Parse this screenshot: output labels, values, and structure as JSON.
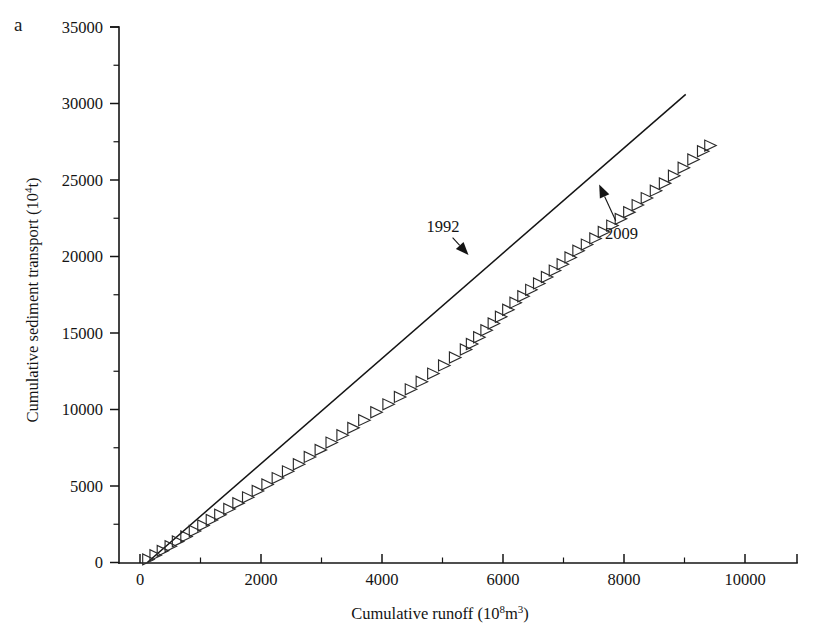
{
  "figure": {
    "panel_label": "a",
    "background_color": "#ffffff",
    "ink_color": "#141414"
  },
  "chart_data": {
    "type": "scatter",
    "title": "",
    "subtitle": "",
    "xlabel": "Cumulative runoff (10⁸m³)",
    "xlabel_parts": {
      "text": "Cumulative runoff (10",
      "sup": "8",
      "tail": "m",
      "sup2": "3",
      "close": ")"
    },
    "ylabel": "Cumulative sediment transport (10⁴t)",
    "ylabel_parts": {
      "text": "Cumulative sediment transport (10",
      "sup": "4",
      "tail": "t)"
    },
    "xlim": [
      0,
      10850
    ],
    "ylim": [
      0,
      35000
    ],
    "xticks": [
      0,
      2000,
      4000,
      6000,
      8000,
      10000
    ],
    "xtick_labels": [
      "0",
      "2000",
      "4000",
      "6000",
      "8000",
      "10000"
    ],
    "xticks_minor": [
      1000,
      3000,
      5000,
      7000,
      9000
    ],
    "yticks": [
      0,
      5000,
      10000,
      15000,
      20000,
      25000,
      30000,
      35000
    ],
    "ytick_labels": [
      "0",
      "5000",
      "10000",
      "15000",
      "20000",
      "25000",
      "30000",
      "35000"
    ],
    "yticks_minor": [
      2500,
      7500,
      12500,
      17500,
      22500,
      27500,
      32500
    ],
    "grid": false,
    "legend": false,
    "marker": "open-right-triangle",
    "series": [
      {
        "name": "Cumulative sediment transport vs cumulative runoff",
        "marker_color": "#2b2b2b",
        "x": [
          130,
          250,
          370,
          500,
          620,
          760,
          900,
          1040,
          1180,
          1320,
          1470,
          1620,
          1780,
          1940,
          2100,
          2270,
          2440,
          2620,
          2800,
          2980,
          3160,
          3340,
          3520,
          3700,
          3900,
          4100,
          4290,
          4470,
          4650,
          4840,
          5020,
          5200,
          5380,
          5480,
          5600,
          5720,
          5840,
          5960,
          6080,
          6200,
          6330,
          6460,
          6590,
          6720,
          6850,
          6980,
          7110,
          7240,
          7380,
          7520,
          7660,
          7800,
          7940,
          8080,
          8220,
          8370,
          8520,
          8670,
          8820,
          8980,
          9140,
          9300,
          9420
        ],
        "y": [
          200,
          480,
          760,
          1060,
          1380,
          1700,
          2060,
          2420,
          2780,
          3120,
          3500,
          3880,
          4260,
          4680,
          5100,
          5520,
          5960,
          6420,
          6900,
          7360,
          7840,
          8320,
          8800,
          9300,
          9820,
          10340,
          10820,
          11320,
          11820,
          12350,
          12880,
          13400,
          13920,
          14280,
          14720,
          15180,
          15620,
          16060,
          16520,
          16980,
          17400,
          17820,
          18240,
          18660,
          19080,
          19500,
          19940,
          20380,
          20780,
          21180,
          21600,
          22020,
          22460,
          22900,
          23360,
          23820,
          24300,
          24780,
          25280,
          25800,
          26340,
          26880,
          27250
        ]
      }
    ],
    "fit_line": {
      "name": "linear reference line",
      "x": [
        120,
        9020
      ],
      "y": [
        0,
        30600
      ],
      "color": "#141414"
    },
    "annotations": [
      {
        "label": "1992",
        "text_x": 5010,
        "text_y": 21900,
        "point_x": 5430,
        "point_y": 20100,
        "arrow": true
      },
      {
        "label": "2009",
        "text_x": 7960,
        "text_y": 21500,
        "point_x": 7590,
        "point_y": 24700,
        "arrow": true
      }
    ]
  }
}
